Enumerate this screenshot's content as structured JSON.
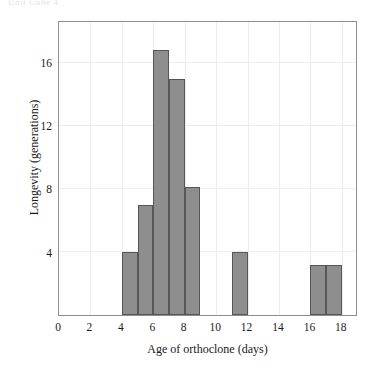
{
  "figure": {
    "top_caption": "Unit Cube 4"
  },
  "chart_data": {
    "type": "bar",
    "title": "",
    "subtitle": "",
    "xlabel": "Age of orthoclone (days)",
    "ylabel": "Longevity (generations)",
    "xlim": [
      0,
      18.9
    ],
    "ylim": [
      0,
      18.6
    ],
    "xticks": [
      0,
      2,
      4,
      6,
      8,
      10,
      12,
      14,
      16,
      18
    ],
    "xtick_labels": [
      "0",
      "2",
      "4",
      "6",
      "8",
      "10",
      "12",
      "14",
      "16",
      "18"
    ],
    "yticks": [
      4,
      8,
      12,
      16
    ],
    "ytick_labels": [
      "4",
      "8",
      "12",
      "16"
    ],
    "grid": true,
    "grid_color": "#ededed",
    "legend": "none",
    "bar_fill_color": "#8e8e8e",
    "bar_edge_color": "#575757",
    "frame_color": "#8d8d8d",
    "bin_width": 1,
    "bins": [
      {
        "x0": 4,
        "x1": 5,
        "value": 4.0
      },
      {
        "x0": 5,
        "x1": 6,
        "value": 7.0
      },
      {
        "x0": 6,
        "x1": 7,
        "value": 16.8
      },
      {
        "x0": 7,
        "x1": 8,
        "value": 15.0
      },
      {
        "x0": 8,
        "x1": 9,
        "value": 8.1
      },
      {
        "x0": 11,
        "x1": 12,
        "value": 4.0
      },
      {
        "x0": 16,
        "x1": 17,
        "value": 3.2
      },
      {
        "x0": 17,
        "x1": 18,
        "value": 3.2
      }
    ]
  }
}
